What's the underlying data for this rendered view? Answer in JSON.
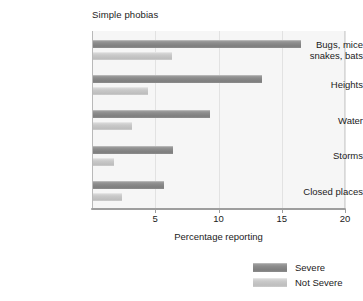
{
  "chart_data": {
    "type": "bar",
    "orientation": "horizontal",
    "title": "Simple phobias",
    "xlabel": "Percentage reporting",
    "ylabel": "",
    "xlim": [
      0,
      20
    ],
    "xticks": [
      5,
      10,
      15,
      20
    ],
    "xtick_labels": [
      "5",
      "10",
      "15",
      "20"
    ],
    "grid": "vertical",
    "legend_position": "bottom-right",
    "categories": [
      "Bugs, mice\nsnakes, bats",
      "Heights",
      "Water",
      "Storms",
      "Closed places"
    ],
    "series": [
      {
        "name": "Severe",
        "color": "#8a8a8a",
        "values": [
          16.5,
          13.4,
          9.3,
          6.4,
          5.7
        ]
      },
      {
        "name": "Not Severe",
        "color": "#c8c8c8",
        "values": [
          6.3,
          4.4,
          3.2,
          1.7,
          2.4
        ]
      }
    ]
  },
  "legend": {
    "items": [
      {
        "label": "Severe"
      },
      {
        "label": "Not Severe"
      }
    ]
  }
}
